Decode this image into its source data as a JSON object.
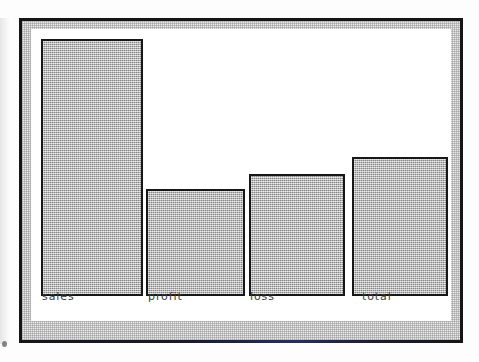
{
  "figure": {
    "kind": "scanned-bar-chart",
    "frame_color": "#151515",
    "band_color": "#e9e9e9",
    "canvas_color": "#ffffff",
    "bar_fill_color": "#aaaaaa",
    "bar_outline_color": "#171717",
    "label_color": "#3b3b3b",
    "bottom_rule_tint": "#2a2f63"
  },
  "chart_data": {
    "type": "bar",
    "title": "",
    "xlabel": "",
    "ylabel": "",
    "grid": false,
    "legend": null,
    "axis_visible": false,
    "categories": [
      "sales",
      "profit",
      "loss",
      "total"
    ],
    "values": [
      100,
      39,
      45,
      52
    ],
    "ylim": [
      0,
      104
    ],
    "tick_labels": {
      "x": [
        "sales",
        "profit",
        "loss",
        "total"
      ],
      "y": []
    },
    "bars": [
      {
        "label": "sales",
        "value": 100,
        "left": 10,
        "width": 102,
        "top": 10,
        "height": 257,
        "label_left": 11,
        "label_top": 261
      },
      {
        "label": "profit",
        "value": 39,
        "left": 115,
        "width": 99,
        "top": 160,
        "height": 107,
        "label_left": 117,
        "label_top": 261
      },
      {
        "label": "loss",
        "value": 45,
        "left": 218,
        "width": 96,
        "top": 145,
        "height": 122,
        "label_left": 219,
        "label_top": 261
      },
      {
        "label": "total",
        "value": 52,
        "left": 321,
        "width": 96,
        "top": 128,
        "height": 139,
        "label_left": 331,
        "label_top": 261
      }
    ]
  }
}
